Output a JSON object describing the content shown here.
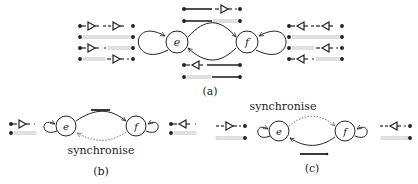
{
  "figure": {
    "panels": [
      {
        "id": "a",
        "caption": "(a)",
        "nodes": [
          "e",
          "f"
        ],
        "edges": [
          {
            "from": "e",
            "to": "e",
            "style": "solid",
            "type": "self-loop"
          },
          {
            "from": "e",
            "to": "f",
            "style": "solid"
          },
          {
            "from": "f",
            "to": "e",
            "style": "solid"
          },
          {
            "from": "f",
            "to": "f",
            "style": "solid",
            "type": "self-loop"
          }
        ]
      },
      {
        "id": "b",
        "caption": "(b)",
        "edge_label": "synchronise",
        "nodes": [
          "e",
          "f"
        ],
        "edges": [
          {
            "from": "e",
            "to": "e",
            "style": "solid",
            "type": "self-loop"
          },
          {
            "from": "e",
            "to": "f",
            "style": "solid"
          },
          {
            "from": "f",
            "to": "e",
            "style": "dotted",
            "label": "synchronise"
          },
          {
            "from": "f",
            "to": "f",
            "style": "solid",
            "type": "self-loop"
          }
        ]
      },
      {
        "id": "c",
        "caption": "(c)",
        "edge_label": "synchronise",
        "nodes": [
          "e",
          "f"
        ],
        "edges": [
          {
            "from": "e",
            "to": "e",
            "style": "solid",
            "type": "self-loop"
          },
          {
            "from": "e",
            "to": "f",
            "style": "dotted",
            "label": "synchronise"
          },
          {
            "from": "f",
            "to": "e",
            "style": "solid"
          },
          {
            "from": "f",
            "to": "f",
            "style": "solid",
            "type": "self-loop"
          }
        ]
      }
    ],
    "node_labels": {
      "e": "e",
      "f": "f"
    },
    "colors": {
      "ink": "#222222",
      "faded": "#d8d8d8"
    }
  }
}
